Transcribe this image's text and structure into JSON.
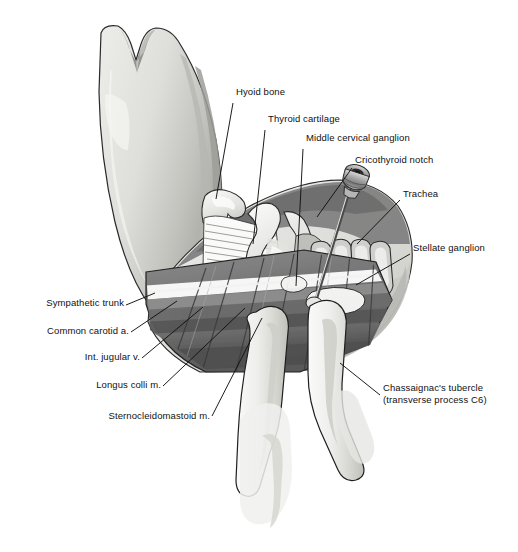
{
  "figure": {
    "background_color": "#ffffff",
    "text_color": "#111111",
    "line_color": "#1a1a1a",
    "palette": {
      "skin_light": "#e9e9e6",
      "skin_mid": "#d2d2cd",
      "skin_shadow": "#b9b9b4",
      "muscle_dark": "#6f6f6f",
      "muscle_darker": "#575757",
      "muscle_mid": "#8c8c8c",
      "cartilage_light": "#f2f2f0",
      "cartilage_mid": "#c9c9c6",
      "vessel_gray": "#9a9a9a",
      "metal_gray": "#a8a8a8",
      "highlight_white": "#fdfdfd"
    }
  },
  "labels": [
    {
      "id": "hyoid-bone",
      "text": "Hyoid bone",
      "align": "left",
      "x": 236,
      "y": 93,
      "leader": [
        [
          233,
          103
        ],
        [
          216,
          199
        ]
      ]
    },
    {
      "id": "thyroid-cartilage",
      "text": "Thyroid cartilage",
      "align": "left",
      "x": 268,
      "y": 120,
      "leader": [
        [
          265,
          130
        ],
        [
          253,
          244
        ]
      ]
    },
    {
      "id": "middle-cervical-ganglion",
      "text": "Middle cervical ganglion",
      "align": "left",
      "x": 306,
      "y": 139,
      "leader": [
        [
          303,
          149
        ],
        [
          296,
          286
        ]
      ]
    },
    {
      "id": "cricothyroid-notch",
      "text": "Cricothyroid notch",
      "align": "left",
      "x": 355,
      "y": 161,
      "leader": [
        [
          352,
          168
        ],
        [
          317,
          217
        ]
      ]
    },
    {
      "id": "trachea",
      "text": "Trachea",
      "align": "left",
      "x": 403,
      "y": 195,
      "leader": [
        [
          400,
          200
        ],
        [
          357,
          244
        ]
      ]
    },
    {
      "id": "stellate-ganglion",
      "text": "Stellate ganglion",
      "align": "left",
      "x": 413,
      "y": 249,
      "leader": [
        [
          410,
          254
        ],
        [
          356,
          285
        ]
      ]
    },
    {
      "id": "sympathetic-trunk",
      "text": "Sympathetic trunk",
      "align": "right",
      "x": 38,
      "y": 303,
      "leader": [
        [
          126,
          305
        ],
        [
          155,
          293
        ]
      ]
    },
    {
      "id": "common-carotid-a",
      "text": "Common carotid a.",
      "align": "right",
      "x": 31,
      "y": 331,
      "leader": [
        [
          131,
          332
        ],
        [
          177,
          301
        ]
      ]
    },
    {
      "id": "int-jugular-v",
      "text": "Int. jugular v.",
      "align": "right",
      "x": 70,
      "y": 357,
      "leader": [
        [
          142,
          358
        ],
        [
          203,
          307
        ]
      ]
    },
    {
      "id": "longus-colli-m",
      "text": "Longus colli m.",
      "align": "right",
      "x": 91,
      "y": 385,
      "leader": [
        [
          163,
          386
        ],
        [
          245,
          308
        ]
      ]
    },
    {
      "id": "sternocleidomastoid-m",
      "text": "Sternocleidomastoid m.",
      "align": "right",
      "x": 99,
      "y": 416,
      "leader": [
        [
          212,
          416
        ],
        [
          262,
          318
        ]
      ]
    }
  ],
  "multiline_labels": [
    {
      "id": "chassaignacs-tubercle",
      "line1": "Chassaignac's tubercle",
      "line2": "(transverse process C6)",
      "align": "left",
      "x": 383,
      "y": 389,
      "leader": [
        [
          380,
          395
        ],
        [
          340,
          363
        ]
      ]
    }
  ],
  "structures": [
    {
      "id": "mandible-chin",
      "name": "mandible and chin profile"
    },
    {
      "id": "neck-skin-flap",
      "name": "reflected skin and superficial fascia"
    },
    {
      "id": "hyoid-bone-shape",
      "name": "hyoid bone"
    },
    {
      "id": "thyrohyoid-membrane",
      "name": "thyrohyoid membrane"
    },
    {
      "id": "thyroid-cartilage-shape",
      "name": "thyroid cartilage"
    },
    {
      "id": "cricoid-cartilage",
      "name": "cricoid cartilage"
    },
    {
      "id": "tracheal-rings",
      "name": "tracheal rings"
    },
    {
      "id": "sternocleidomastoid-muscle",
      "name": "sternocleidomastoid muscle"
    },
    {
      "id": "longus-colli-muscle",
      "name": "longus colli muscle"
    },
    {
      "id": "carotid-sheath",
      "name": "carotid sheath vessels"
    },
    {
      "id": "sympathetic-chain",
      "name": "cervical sympathetic chain"
    },
    {
      "id": "stellate-ganglion-shape",
      "name": "stellate ganglion"
    },
    {
      "id": "needle-and-syringe",
      "name": "block needle with syringe hub"
    },
    {
      "id": "retracting-fingers",
      "name": "two retracting fingers"
    }
  ]
}
